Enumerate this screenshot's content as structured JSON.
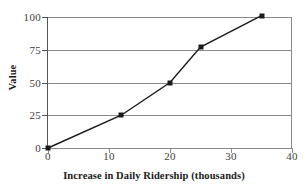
{
  "chart_data": {
    "type": "line",
    "title": "",
    "xlabel": "Increase in Daily Ridership (thousands)",
    "ylabel": "Value",
    "xlim": [
      0,
      40
    ],
    "ylim": [
      0,
      100
    ],
    "xticks": [
      0,
      10,
      20,
      30,
      40
    ],
    "yticks": [
      0,
      25,
      50,
      75,
      100
    ],
    "xtick_labels": [
      "0",
      "10",
      "20",
      "30",
      "40"
    ],
    "ytick_labels": [
      "0",
      "25",
      "50",
      "75",
      "100"
    ],
    "grid": "horizontal",
    "legend": "none",
    "series": [
      {
        "name": "value",
        "marker": "square",
        "color": "#1a1a1a",
        "points": [
          {
            "x": 0,
            "y": 0
          },
          {
            "x": 12,
            "y": 25
          },
          {
            "x": 20,
            "y": 50
          },
          {
            "x": 25,
            "y": 77
          },
          {
            "x": 35,
            "y": 101
          }
        ]
      }
    ]
  },
  "style": {
    "grid_color": "#8a8a8a",
    "axis_color": "#8a8a8a",
    "line_color": "#1a1a1a",
    "text_color": "#404040",
    "title_color": "#1a1a1a",
    "background": "#ffffff"
  }
}
